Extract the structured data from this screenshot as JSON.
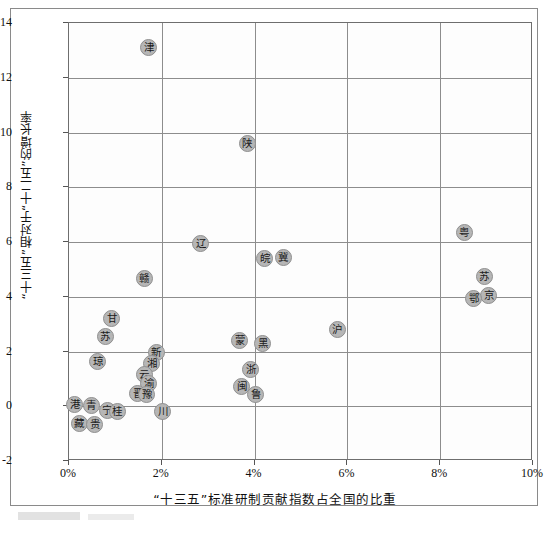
{
  "chart_data": {
    "type": "scatter",
    "title": "",
    "xlabel": "“十三五”标准研制贡献指数占全国的比重",
    "ylabel": "“十三五”相对于“十二五”的增长率",
    "xlim": [
      0,
      10
    ],
    "ylim": [
      -2,
      14
    ],
    "xticks": [
      0,
      2,
      4,
      6,
      8,
      10
    ],
    "xticklabels": [
      "0%",
      "2%",
      "4%",
      "6%",
      "8%",
      "10%"
    ],
    "yticks": [
      -2,
      0,
      2,
      4,
      6,
      8,
      10,
      12,
      14
    ],
    "yticklabels": [
      "-2",
      "0",
      "2",
      "4",
      "6",
      "8",
      "10",
      "12",
      "14"
    ],
    "grid": true,
    "legend": "none",
    "marker_color": "#b6b6b6",
    "marker_edge_color": "#8f8f8f",
    "points": [
      {
        "label": "津",
        "x": 1.72,
        "y": 13.1
      },
      {
        "label": "陕",
        "x": 3.84,
        "y": 9.6
      },
      {
        "label": "粤",
        "x": 8.52,
        "y": 6.35
      },
      {
        "label": "辽",
        "x": 2.84,
        "y": 5.95
      },
      {
        "label": "皖",
        "x": 4.22,
        "y": 5.4
      },
      {
        "label": "冀",
        "x": 4.62,
        "y": 5.42
      },
      {
        "label": "苏",
        "x": 8.95,
        "y": 4.75
      },
      {
        "label": "赣",
        "x": 1.62,
        "y": 4.65
      },
      {
        "label": "京",
        "x": 9.05,
        "y": 4.05
      },
      {
        "label": "鄂",
        "x": 8.72,
        "y": 3.95
      },
      {
        "label": "甘",
        "x": 0.92,
        "y": 3.2
      },
      {
        "label": "沪",
        "x": 5.78,
        "y": 2.8
      },
      {
        "label": "苏2",
        "x": 0.78,
        "y": 2.55
      },
      {
        "label": "蒙",
        "x": 3.68,
        "y": 2.4
      },
      {
        "label": "黑",
        "x": 4.18,
        "y": 2.3
      },
      {
        "label": "新",
        "x": 1.88,
        "y": 1.95
      },
      {
        "label": "琼",
        "x": 0.62,
        "y": 1.65
      },
      {
        "label": "湘",
        "x": 1.78,
        "y": 1.55
      },
      {
        "label": "浙",
        "x": 3.92,
        "y": 1.35
      },
      {
        "label": "云",
        "x": 1.62,
        "y": 1.15
      },
      {
        "label": "渝",
        "x": 1.72,
        "y": 0.82
      },
      {
        "label": "闽",
        "x": 3.72,
        "y": 0.72
      },
      {
        "label": "晋",
        "x": 1.48,
        "y": 0.48
      },
      {
        "label": "豫",
        "x": 1.68,
        "y": 0.42
      },
      {
        "label": "鲁",
        "x": 4.02,
        "y": 0.42
      },
      {
        "label": "港",
        "x": 0.12,
        "y": 0.05
      },
      {
        "label": "青",
        "x": 0.48,
        "y": 0.02
      },
      {
        "label": "宁",
        "x": 0.82,
        "y": -0.15
      },
      {
        "label": "桂",
        "x": 1.04,
        "y": -0.18
      },
      {
        "label": "川",
        "x": 2.02,
        "y": -0.2
      },
      {
        "label": "藏",
        "x": 0.22,
        "y": -0.62
      },
      {
        "label": "贵",
        "x": 0.56,
        "y": -0.68
      }
    ]
  },
  "axis": {
    "x_ticks": [
      {
        "value": 0,
        "label": "0%"
      },
      {
        "value": 2,
        "label": "2%"
      },
      {
        "value": 4,
        "label": "4%"
      },
      {
        "value": 6,
        "label": "6%"
      },
      {
        "value": 8,
        "label": "8%"
      },
      {
        "value": 10,
        "label": "10%"
      }
    ],
    "y_ticks": [
      {
        "value": 14,
        "label": "14"
      },
      {
        "value": 12,
        "label": "12"
      },
      {
        "value": 10,
        "label": "10"
      },
      {
        "value": 8,
        "label": "8"
      },
      {
        "value": 6,
        "label": "6"
      },
      {
        "value": 4,
        "label": "4"
      },
      {
        "value": 2,
        "label": "2"
      },
      {
        "value": 0,
        "label": "0"
      },
      {
        "value": -2,
        "label": "-2"
      }
    ]
  }
}
